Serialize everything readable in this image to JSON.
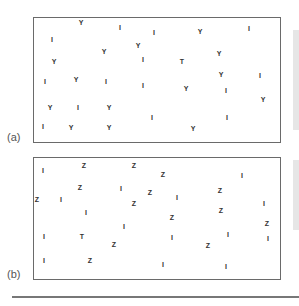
{
  "panels": [
    {
      "id": "a",
      "label": "(a)",
      "glyphs": [
        {
          "c": "Y",
          "x": 81,
          "y": 22
        },
        {
          "c": "I",
          "x": 120,
          "y": 27
        },
        {
          "c": "I",
          "x": 154,
          "y": 32
        },
        {
          "c": "Y",
          "x": 200,
          "y": 31
        },
        {
          "c": "I",
          "x": 249,
          "y": 28
        },
        {
          "c": "I",
          "x": 52,
          "y": 39
        },
        {
          "c": "Y",
          "x": 104,
          "y": 51
        },
        {
          "c": "Y",
          "x": 138,
          "y": 45
        },
        {
          "c": "Y",
          "x": 54,
          "y": 61
        },
        {
          "c": "I",
          "x": 143,
          "y": 59
        },
        {
          "c": "Y",
          "x": 219,
          "y": 53
        },
        {
          "c": "T",
          "x": 182,
          "y": 61
        },
        {
          "c": "I",
          "x": 45,
          "y": 81
        },
        {
          "c": "Y",
          "x": 76,
          "y": 79
        },
        {
          "c": "I",
          "x": 106,
          "y": 81
        },
        {
          "c": "I",
          "x": 143,
          "y": 85
        },
        {
          "c": "Y",
          "x": 221,
          "y": 74
        },
        {
          "c": "I",
          "x": 260,
          "y": 75
        },
        {
          "c": "Y",
          "x": 186,
          "y": 88
        },
        {
          "c": "I",
          "x": 226,
          "y": 90
        },
        {
          "c": "Y",
          "x": 263,
          "y": 99
        },
        {
          "c": "Y",
          "x": 50,
          "y": 107
        },
        {
          "c": "I",
          "x": 78,
          "y": 107
        },
        {
          "c": "Y",
          "x": 109,
          "y": 107
        },
        {
          "c": "I",
          "x": 152,
          "y": 117
        },
        {
          "c": "I",
          "x": 227,
          "y": 117
        },
        {
          "c": "I",
          "x": 43,
          "y": 126
        },
        {
          "c": "Y",
          "x": 71,
          "y": 127
        },
        {
          "c": "Y",
          "x": 109,
          "y": 127
        },
        {
          "c": "Y",
          "x": 193,
          "y": 128
        }
      ]
    },
    {
      "id": "b",
      "label": "(b)",
      "glyphs": [
        {
          "c": "I",
          "x": 43,
          "y": 170
        },
        {
          "c": "Z",
          "x": 84,
          "y": 165
        },
        {
          "c": "Z",
          "x": 134,
          "y": 165
        },
        {
          "c": "Z",
          "x": 163,
          "y": 174
        },
        {
          "c": "I",
          "x": 242,
          "y": 175
        },
        {
          "c": "Z",
          "x": 80,
          "y": 187
        },
        {
          "c": "I",
          "x": 121,
          "y": 188
        },
        {
          "c": "Z",
          "x": 150,
          "y": 192
        },
        {
          "c": "Z",
          "x": 37,
          "y": 199
        },
        {
          "c": "I",
          "x": 61,
          "y": 199
        },
        {
          "c": "I",
          "x": 177,
          "y": 197
        },
        {
          "c": "Z",
          "x": 220,
          "y": 190
        },
        {
          "c": "Z",
          "x": 134,
          "y": 203
        },
        {
          "c": "I",
          "x": 264,
          "y": 203
        },
        {
          "c": "Z",
          "x": 221,
          "y": 210
        },
        {
          "c": "I",
          "x": 86,
          "y": 212
        },
        {
          "c": "Z",
          "x": 172,
          "y": 217
        },
        {
          "c": "Z",
          "x": 267,
          "y": 223
        },
        {
          "c": "I",
          "x": 124,
          "y": 226
        },
        {
          "c": "I",
          "x": 228,
          "y": 234
        },
        {
          "c": "I",
          "x": 44,
          "y": 236
        },
        {
          "c": "T",
          "x": 82,
          "y": 236
        },
        {
          "c": "I",
          "x": 172,
          "y": 237
        },
        {
          "c": "I",
          "x": 268,
          "y": 238
        },
        {
          "c": "Z",
          "x": 114,
          "y": 244
        },
        {
          "c": "Z",
          "x": 208,
          "y": 245
        },
        {
          "c": "I",
          "x": 44,
          "y": 260
        },
        {
          "c": "Z",
          "x": 90,
          "y": 260
        },
        {
          "c": "I",
          "x": 163,
          "y": 264
        },
        {
          "c": "I",
          "x": 226,
          "y": 266
        }
      ]
    }
  ]
}
